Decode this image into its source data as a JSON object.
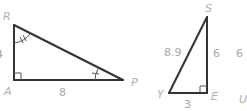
{
  "figure": {
    "triangle_left": {
      "vertices": {
        "top": "R",
        "right_angle": "A",
        "acute": "P"
      },
      "sides": {
        "RA": "4",
        "AP": "8"
      },
      "angle_marks": {
        "R": "double arc tick",
        "P": "single arc tick"
      },
      "right_angle_at": "A"
    },
    "triangle_right": {
      "vertices": {
        "top": "S",
        "bottom_left": "Y",
        "right_angle": "E"
      },
      "sides": {
        "YS": "8.9",
        "SE": "6",
        "YE": "3"
      },
      "right_angle_at": "E"
    },
    "partial_labels": {
      "cut_number": "6",
      "cut_vertex": "U"
    }
  }
}
